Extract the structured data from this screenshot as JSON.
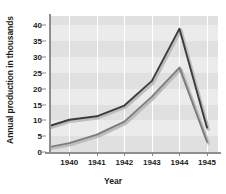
{
  "chart_data": {
    "type": "line",
    "title": "",
    "xlabel": "Year",
    "ylabel": "Annual production in thousands",
    "xlim": [
      1939.3,
      1945.4
    ],
    "ylim": [
      0,
      43
    ],
    "grid": "horizontal-bands-and-vertical-white-lines",
    "legend": "none",
    "x": [
      1939.3,
      1940,
      1941,
      1942,
      1943,
      1944,
      1945
    ],
    "xtick_labels": [
      "1940",
      "1941",
      "1942",
      "1943",
      "1944",
      "1945"
    ],
    "xticks": [
      1940,
      1941,
      1942,
      1943,
      1944,
      1945
    ],
    "ytick_labels": [
      "0",
      "5",
      "10",
      "15",
      "20",
      "25",
      "30",
      "35",
      "40"
    ],
    "yticks": [
      0,
      5,
      10,
      15,
      20,
      25,
      30,
      35,
      40
    ],
    "series": [
      {
        "name": "upper-series",
        "color": "#3d3d3d",
        "values": [
          8.3,
          10.2,
          11.3,
          14.7,
          22.5,
          39.0,
          7.7
        ]
      },
      {
        "name": "lower-series",
        "color": "#7d7d7d",
        "values": [
          1.6,
          2.8,
          5.5,
          9.6,
          17.5,
          26.7,
          3.3
        ]
      }
    ]
  },
  "colors": {
    "plot_background": "#ebebeb",
    "band": "#e0e0e0",
    "gridline": "#ffffff",
    "axis": "#8f8f8f",
    "text": "#1b1b1b",
    "upper_line": "#3d3d3d",
    "lower_line": "#7d7d7d"
  }
}
